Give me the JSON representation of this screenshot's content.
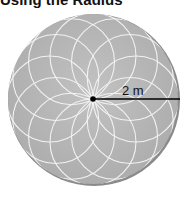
{
  "heading": "Using the Radius",
  "diagram": {
    "shape": "circle",
    "pattern": "overlapping-circles rosette",
    "radius_label": "2 m",
    "fill_color": "#b4b4b4",
    "edge_color": "#7a7a7a",
    "line_color": "#000000"
  }
}
